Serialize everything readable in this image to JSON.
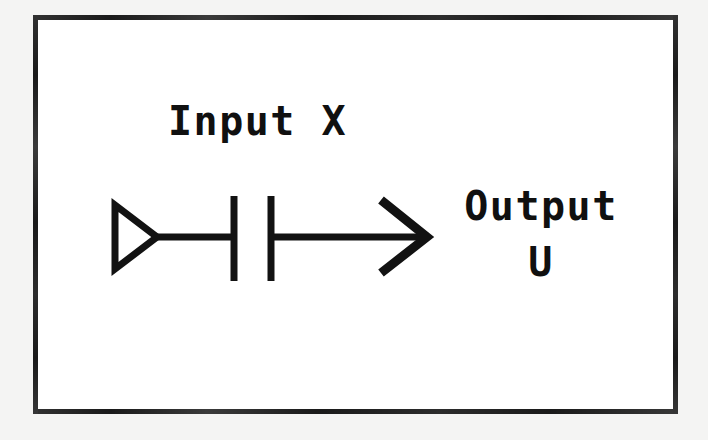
{
  "figure": {
    "kind": "block-diagram",
    "style": "scanned-line-art",
    "background_color": "#f4f4f3",
    "panel_color": "#ffffff",
    "ink_color": "#101010"
  },
  "labels": {
    "input": "Input X",
    "output_line1": "Output",
    "output_line2": "U"
  },
  "symbols": [
    {
      "name": "buffer-triangle",
      "description": "open triangle pointing right",
      "filled": false
    },
    {
      "name": "capacitor",
      "description": "two parallel vertical plates"
    },
    {
      "name": "signal-arrow",
      "description": "open chevron arrowhead pointing right"
    }
  ],
  "geometry": {
    "frame": {
      "x": 33,
      "y": 15,
      "w": 645,
      "h": 399,
      "stroke": 5
    },
    "wire_y": 237,
    "triangle": {
      "x1": 113,
      "y1": 206,
      "x2": 113,
      "y2": 268,
      "tip_x": 156
    },
    "plate1_x": 234,
    "plate2_x": 271,
    "plate_top": 196,
    "plate_bottom": 281,
    "arrow_tip_x": 427,
    "wire_stroke": 7
  }
}
